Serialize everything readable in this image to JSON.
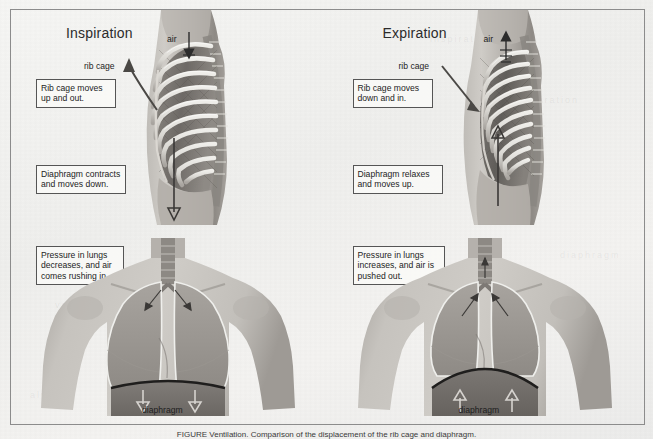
{
  "figure": {
    "caption": "FIGURE   Ventilation. Comparison of the displacement of the rib cage and diaphragm."
  },
  "panels": [
    {
      "id": "inspiration",
      "title": "Inspiration",
      "air_label": "air",
      "air_direction": "down",
      "ribcage_label": "rib cage",
      "diaphragm_label": "diaphragm",
      "diaphragm_arrow_direction": "down",
      "callouts": [
        {
          "id": "rib-cage",
          "text": "Rib cage moves\nup and out."
        },
        {
          "id": "diaphragm",
          "text": "Diaphragm contracts\nand moves down."
        },
        {
          "id": "pressure",
          "text": "Pressure in lungs\ndecreases, and air\ncomes rushing in."
        }
      ]
    },
    {
      "id": "expiration",
      "title": "Expiration",
      "air_label": "air",
      "air_direction": "up",
      "ribcage_label": "rib cage",
      "diaphragm_label": "diaphragm",
      "diaphragm_arrow_direction": "up",
      "callouts": [
        {
          "id": "rib-cage",
          "text": "Rib cage moves\ndown and in."
        },
        {
          "id": "diaphragm",
          "text": "Diaphragm relaxes\nand moves up."
        },
        {
          "id": "pressure",
          "text": "Pressure in lungs\nincreases, and air is\npushed out."
        }
      ]
    }
  ],
  "colors": {
    "paper": "#f2f2f0",
    "frame": "#8c8c8c",
    "ink": "#1d1d1d",
    "skin_light": "#c9c6c2",
    "skin_mid": "#a9a5a1",
    "skin_dark": "#8b8782",
    "bone": "#e2e0dc",
    "cavity": "#6f6c68",
    "lung": "#9b9793",
    "arrow": "#2c2c2c"
  },
  "ghost_text": [
    "inspiration",
    "expiration",
    "ventilation",
    "diaphragm",
    "rib cage",
    "alveoli"
  ]
}
